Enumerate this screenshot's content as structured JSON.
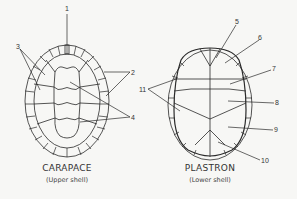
{
  "carapace": {
    "title": "CARAPACE",
    "subtitle": "(Upper shell)",
    "labels": [
      "1",
      "2",
      "3",
      "4"
    ]
  },
  "plastron": {
    "title": "PLASTRON",
    "subtitle": "(Lower shell)",
    "labels": [
      "5",
      "6",
      "7",
      "8",
      "9",
      "10",
      "11"
    ]
  },
  "colors": {
    "line": "#2a2a2a",
    "background": "#f7f7f5"
  }
}
